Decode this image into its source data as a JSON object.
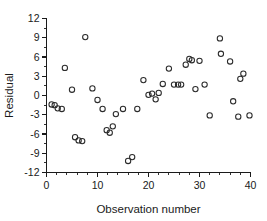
{
  "chart_data": {
    "type": "scatter",
    "title": "",
    "xlabel": "Observation number",
    "ylabel": "Residual",
    "xlim": [
      0,
      40
    ],
    "ylim": [
      -12,
      12
    ],
    "xticks": [
      0,
      10,
      20,
      30,
      40
    ],
    "xtick_labels": [
      "0",
      "10",
      "20",
      "30",
      "40"
    ],
    "xminor_step": 2,
    "yticks": [
      -12,
      -9,
      -6,
      -3,
      0,
      3,
      6,
      9,
      12
    ],
    "ytick_labels": [
      "-12",
      "-9",
      "-6",
      "-3",
      "0",
      "3",
      "6",
      "9",
      "12"
    ],
    "grid": false,
    "legend": null,
    "marker": "open-circle",
    "marker_color": "#2b2b2b",
    "x": [
      1,
      1.6,
      2.2,
      3,
      3.6,
      5,
      5.6,
      6.3,
      7,
      7.6,
      9,
      9.6,
      11,
      11.6,
      12.3,
      13,
      13.6,
      15,
      16,
      17,
      19,
      20,
      20.6,
      21.3,
      22,
      23,
      24,
      25,
      25.6,
      26.3,
      27,
      28,
      28.6,
      30,
      31,
      32,
      33,
      34,
      35.6,
      36.6,
      37.6,
      38.3,
      39.6
    ],
    "y": [
      -1.4,
      -1.5,
      -2.1,
      -2.1,
      4.3,
      0.9,
      -6.5,
      -7.1,
      -7.0,
      9.1,
      1.1,
      -0.7,
      -2.1,
      -5.4,
      -5.8,
      -4.8,
      -2.9,
      -2.1,
      -10.2,
      -9.6,
      -2.0,
      2.4,
      0.1,
      0.3,
      -0.6,
      0.4,
      1.8,
      1.7,
      4.2,
      1.7,
      1.7,
      4.8,
      5.7,
      5.6,
      5.4,
      1.0,
      1.7,
      -3.1,
      8.9,
      6.5,
      5.3,
      -0.9,
      -3.3,
      2.6,
      3.4,
      -3.1
    ],
    "points": [
      {
        "x": 1,
        "y": -1.4
      },
      {
        "x": 1.6,
        "y": -1.5
      },
      {
        "x": 2.2,
        "y": -2.0
      },
      {
        "x": 3,
        "y": -2.1
      },
      {
        "x": 3.6,
        "y": 4.3
      },
      {
        "x": 5,
        "y": 0.9
      },
      {
        "x": 5.6,
        "y": -6.5
      },
      {
        "x": 6.3,
        "y": -7.0
      },
      {
        "x": 7,
        "y": -7.1
      },
      {
        "x": 7.6,
        "y": 9.1
      },
      {
        "x": 9,
        "y": 1.1
      },
      {
        "x": 10,
        "y": -0.7
      },
      {
        "x": 11,
        "y": -2.1
      },
      {
        "x": 11.8,
        "y": -5.4
      },
      {
        "x": 12.4,
        "y": -5.8
      },
      {
        "x": 13,
        "y": -4.8
      },
      {
        "x": 13.6,
        "y": -2.9
      },
      {
        "x": 15,
        "y": -2.1
      },
      {
        "x": 16,
        "y": -10.2
      },
      {
        "x": 16.8,
        "y": -9.6
      },
      {
        "x": 17.8,
        "y": -2.1
      },
      {
        "x": 19,
        "y": 2.4
      },
      {
        "x": 20,
        "y": 0.1
      },
      {
        "x": 20.7,
        "y": 0.3
      },
      {
        "x": 21.4,
        "y": -0.6
      },
      {
        "x": 22,
        "y": 0.4
      },
      {
        "x": 22.8,
        "y": 1.8
      },
      {
        "x": 24,
        "y": 4.2
      },
      {
        "x": 25,
        "y": 1.7
      },
      {
        "x": 25.8,
        "y": 1.7
      },
      {
        "x": 26.4,
        "y": 1.7
      },
      {
        "x": 27.3,
        "y": 4.8
      },
      {
        "x": 28,
        "y": 5.7
      },
      {
        "x": 28.5,
        "y": 5.5
      },
      {
        "x": 30,
        "y": 5.4
      },
      {
        "x": 29.2,
        "y": 1.0
      },
      {
        "x": 31,
        "y": 1.7
      },
      {
        "x": 32,
        "y": -3.1
      },
      {
        "x": 34,
        "y": 8.9
      },
      {
        "x": 34.2,
        "y": 6.5
      },
      {
        "x": 36,
        "y": 5.3
      },
      {
        "x": 36.6,
        "y": -0.9
      },
      {
        "x": 37.6,
        "y": -3.3
      },
      {
        "x": 38,
        "y": 2.6
      },
      {
        "x": 38.6,
        "y": 3.4
      },
      {
        "x": 39.8,
        "y": -3.1
      }
    ]
  }
}
